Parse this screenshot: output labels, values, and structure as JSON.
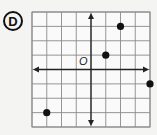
{
  "choice": {
    "label": "D"
  },
  "chart_data": {
    "type": "scatter",
    "title": "",
    "xlabel": "",
    "ylabel": "",
    "origin_label": "O",
    "xlim": [
      -4,
      4
    ],
    "ylim": [
      -4,
      4
    ],
    "grid": true,
    "grid_step": 1,
    "points": [
      {
        "x": 2,
        "y": 3
      },
      {
        "x": 1,
        "y": 1
      },
      {
        "x": 4,
        "y": -1
      },
      {
        "x": -3,
        "y": -3
      }
    ]
  },
  "colors": {
    "grid": "#8a8a8a",
    "axis": "#222222",
    "point": "#111111",
    "background": "#f4f4f2"
  }
}
